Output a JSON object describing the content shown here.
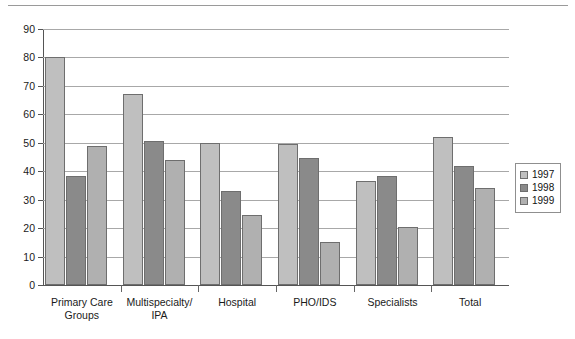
{
  "chart_data": {
    "type": "bar",
    "title": "",
    "subtitle": "",
    "xlabel": "",
    "ylabel": "",
    "ylim": [
      0,
      90
    ],
    "ytick_step": 10,
    "yticks": [
      0,
      10,
      20,
      30,
      40,
      50,
      60,
      70,
      80,
      90
    ],
    "ytick_labels": [
      "0",
      "10",
      "20",
      "30",
      "40",
      "50",
      "60",
      "70",
      "80",
      "90"
    ],
    "grid": true,
    "grid_axis": "y",
    "legend_position": "right",
    "categories": [
      "Primary Care Groups",
      "Multispecialty/ IPA",
      "Hospital",
      "PHO/IDS",
      "Specialists",
      "Total"
    ],
    "category_lines": [
      [
        "Primary Care",
        "Groups"
      ],
      [
        "Multispecialty/",
        "IPA"
      ],
      [
        "Hospital"
      ],
      [
        "PHO/IDS"
      ],
      [
        "Specialists"
      ],
      [
        "Total"
      ]
    ],
    "series": [
      {
        "name": "1997",
        "color": "#bfbfbf",
        "values": [
          80,
          67,
          50,
          49.5,
          36.5,
          52
        ]
      },
      {
        "name": "1998",
        "color": "#8a8a8a",
        "values": [
          38.5,
          50.5,
          33,
          44.5,
          38.5,
          42
        ]
      },
      {
        "name": "1999",
        "color": "#b0b0b0",
        "values": [
          49,
          44,
          24.5,
          15,
          20.5,
          34
        ]
      }
    ]
  },
  "legend": {
    "items": [
      {
        "label": "1997",
        "color": "#bfbfbf"
      },
      {
        "label": "1998",
        "color": "#8a8a8a"
      },
      {
        "label": "1999",
        "color": "#b0b0b0"
      }
    ]
  },
  "colors": {
    "series_1997": "#bfbfbf",
    "series_1998": "#8a8a8a",
    "series_1999": "#b0b0b0",
    "bar_border": "#6e6e6e",
    "gridline": "#a8a8a8",
    "axis": "#555555",
    "background": "#ffffff",
    "text": "#1a1a1a"
  }
}
